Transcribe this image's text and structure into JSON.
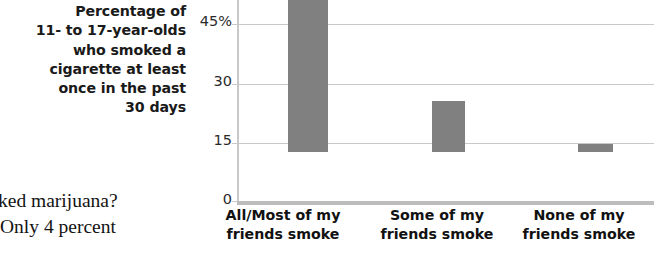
{
  "caption": {
    "lines": [
      "Percentage of",
      "11- to 17-year-olds",
      "who smoked a",
      "cigarette at least",
      "once in the past",
      "30 days"
    ]
  },
  "body_text": {
    "lines": [
      "ked marijuana?",
      "Only 4 percent"
    ]
  },
  "chart_data": {
    "type": "bar",
    "title": "Percentage of 11- to 17-year-olds who smoked a cigarette at least once in the past 30 days",
    "xlabel": "",
    "ylabel": "",
    "categories": [
      "All/Most of my friends smoke",
      "Some of my friends smoke",
      "None of my friends smoke"
    ],
    "category_lines": [
      [
        "All/Most of my",
        "friends smoke"
      ],
      [
        "Some of my",
        "friends smoke"
      ],
      [
        "None of my",
        "friends smoke"
      ]
    ],
    "values": [
      44,
      13,
      2
    ],
    "ylim": [
      0,
      45
    ],
    "yticks": [
      0,
      15,
      30,
      45
    ],
    "ytick_labels": [
      "0",
      "15",
      "30",
      "45%"
    ],
    "grid": true,
    "legend": "none",
    "bar_color": "#808080",
    "gridline_color": "#c9c9c9",
    "axis_color": "#bdbdbd"
  }
}
